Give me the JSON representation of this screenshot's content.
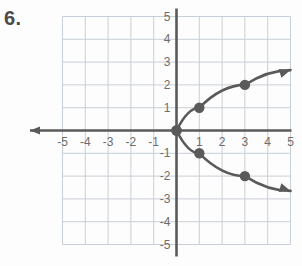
{
  "problem": {
    "number": "6."
  },
  "chart_data": {
    "type": "scatter",
    "title": "",
    "xlabel": "",
    "ylabel": "",
    "xlim": [
      -5,
      5
    ],
    "ylim": [
      -5,
      5
    ],
    "grid": true,
    "legend": false,
    "x_ticks": [
      "-5",
      "-4",
      "-3",
      "-2",
      "-1",
      "1",
      "2",
      "3",
      "4",
      "5"
    ],
    "x_tick_values": [
      -5,
      -4,
      -3,
      -2,
      -1,
      1,
      2,
      3,
      4,
      5
    ],
    "y_ticks": [
      "5",
      "4",
      "3",
      "2",
      "1",
      "-1",
      "-2",
      "-3",
      "-4",
      "-5"
    ],
    "y_tick_values": [
      5,
      4,
      3,
      2,
      1,
      -1,
      -2,
      -3,
      -4,
      -5
    ],
    "axis_color": "#5a5a5a",
    "grid_color": "#c9cfd6",
    "curve_color": "#5a5a5a",
    "point_color": "#5a5a5a",
    "series": [
      {
        "name": "upper-branch",
        "points": [
          {
            "x": 0,
            "y": 0
          },
          {
            "x": 1,
            "y": 1
          },
          {
            "x": 3,
            "y": 2
          }
        ],
        "path": [
          {
            "x": 0,
            "y": 0
          },
          {
            "x": 1,
            "y": 1
          },
          {
            "x": 3,
            "y": 2
          },
          {
            "x": 5,
            "y": 2.65
          }
        ],
        "arrow_end": true
      },
      {
        "name": "lower-branch",
        "points": [
          {
            "x": 0,
            "y": 0
          },
          {
            "x": 1,
            "y": -1
          },
          {
            "x": 3,
            "y": -2
          }
        ],
        "path": [
          {
            "x": 0,
            "y": 0
          },
          {
            "x": 1,
            "y": -1
          },
          {
            "x": 3,
            "y": -2
          },
          {
            "x": 5,
            "y": -2.65
          }
        ],
        "arrow_end": true
      }
    ],
    "plotted_points_labels": [
      "(0, 0)",
      "(1, 1)",
      "(3, 2)",
      "(1, -1)",
      "(3, -2)"
    ]
  }
}
